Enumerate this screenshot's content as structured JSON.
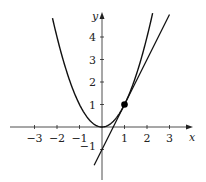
{
  "chart_data": {
    "type": "line",
    "title": "",
    "xlabel": "x",
    "ylabel": "y",
    "xlim": [
      -4.4,
      3.9
    ],
    "ylim": [
      -1.7,
      5.0
    ],
    "grid": false,
    "legend": null,
    "x_ticks": [
      -3,
      -2,
      -1,
      1,
      2,
      3
    ],
    "y_ticks": [
      -1,
      1,
      2,
      3,
      4
    ],
    "x_tick_labels": [
      "−3",
      "−2",
      "−1",
      "1",
      "2",
      "3"
    ],
    "y_tick_labels": [
      "−1",
      "1",
      "2",
      "3",
      "4"
    ],
    "series": [
      {
        "name": "parabola",
        "expression": "y = x^2",
        "x_range": [
          -2.2,
          2.25
        ],
        "color": "#111111"
      },
      {
        "name": "tangent line",
        "expression": "y = 2x - 1",
        "x_range": [
          -0.35,
          3.0
        ],
        "color": "#111111"
      }
    ],
    "points": [
      {
        "name": "tangent point",
        "x": 1,
        "y": 1,
        "color": "#000000"
      }
    ]
  },
  "labels": {
    "x_axis": "x",
    "y_axis": "y"
  }
}
